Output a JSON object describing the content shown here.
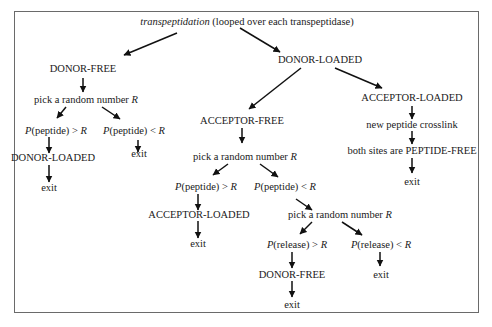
{
  "diagram": {
    "root": {
      "italic": "transpeptidation",
      "rest": " (looped over each transpeptidase)"
    },
    "left": {
      "state": "DONOR-FREE",
      "pick": {
        "text": "pick a random number ",
        "var": "R"
      },
      "gt": {
        "p": "P",
        "arg": "(peptide) > ",
        "var": "R"
      },
      "lt": {
        "p": "P",
        "arg": "(peptide) < ",
        "var": "R"
      },
      "gt_state": "DONOR-LOADED",
      "gt_exit": "exit",
      "lt_exit": "exit"
    },
    "right": {
      "state": "DONOR-LOADED",
      "acceptor_free": {
        "state": "ACCEPTOR-FREE",
        "pick": {
          "text": "pick a random number ",
          "var": "R"
        },
        "gt": {
          "p": "P",
          "arg": "(peptide) > ",
          "var": "R"
        },
        "lt": {
          "p": "P",
          "arg": "(peptide) < ",
          "var": "R"
        },
        "gt_state": "ACCEPTOR-LOADED",
        "gt_exit": "exit",
        "pick2": {
          "text": "pick a random number ",
          "var": "R"
        },
        "rel_gt": {
          "p": "P",
          "arg": "(release) > ",
          "var": "R"
        },
        "rel_lt": {
          "p": "P",
          "arg": "(release) < ",
          "var": "R"
        },
        "rel_gt_state": "DONOR-FREE",
        "rel_gt_exit": "exit",
        "rel_lt_exit": "exit"
      },
      "acceptor_loaded": {
        "state": "ACCEPTOR-LOADED",
        "step1": "new peptide crosslink",
        "step2": "both sites are PEPTIDE-FREE",
        "exit": "exit"
      }
    }
  },
  "colors": {
    "line": "#111111",
    "border": "#6a6a6a",
    "text": "#1a1a1a"
  }
}
